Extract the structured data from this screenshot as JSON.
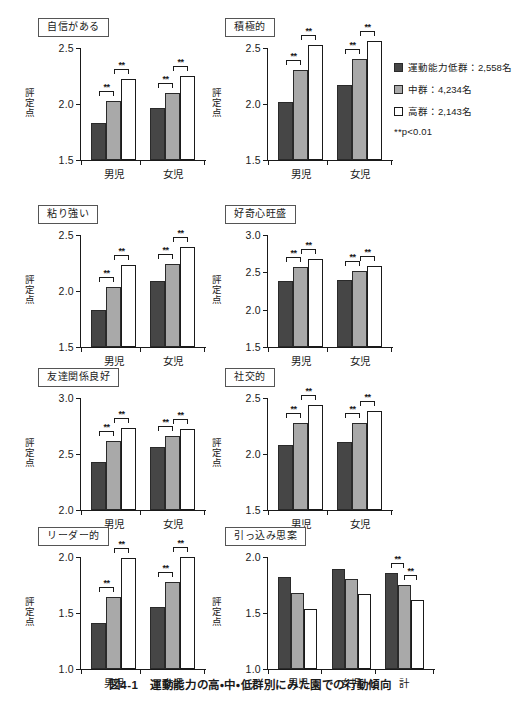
{
  "figure": {
    "caption": "図4-1　運動能力の高・中・低群別にみた園での行動傾向",
    "y_axis_label": "評定点",
    "significance_note": "**p<0.01",
    "stars": "**"
  },
  "legend": {
    "items": [
      {
        "key": "low",
        "label": "運動能力低群：2,558名",
        "color": "#464646"
      },
      {
        "key": "mid",
        "label": "中群：4,234名",
        "color": "#a9a9a9"
      },
      {
        "key": "high",
        "label": "高群：2,143名",
        "color": "#ffffff"
      }
    ],
    "pvalue": "**p<0.01"
  },
  "chart_data": [
    {
      "id": "panel-confidence",
      "type": "bar",
      "title": "自信がある",
      "ylabel": "評定点",
      "ylim": [
        1.5,
        2.5
      ],
      "yticks": [
        1.5,
        2.0,
        2.5
      ],
      "ytick_labels": [
        "1.5",
        "2.0",
        "2.5"
      ],
      "categories": [
        "男児",
        "女児"
      ],
      "series": [
        {
          "name": "運動能力低群：2,558名",
          "key": "low",
          "values": [
            1.83,
            1.96
          ]
        },
        {
          "name": "中群：4,234名",
          "key": "mid",
          "values": [
            2.03,
            2.1
          ]
        },
        {
          "name": "高群：2,143名",
          "key": "high",
          "values": [
            2.22,
            2.25
          ]
        }
      ],
      "significance": [
        {
          "group": 0,
          "between": [
            0,
            1
          ],
          "stars": "**"
        },
        {
          "group": 0,
          "between": [
            1,
            2
          ],
          "stars": "**"
        },
        {
          "group": 1,
          "between": [
            0,
            1
          ],
          "stars": "**"
        },
        {
          "group": 1,
          "between": [
            1,
            2
          ],
          "stars": "**"
        }
      ]
    },
    {
      "id": "panel-active",
      "type": "bar",
      "title": "積極的",
      "ylabel": "評定点",
      "ylim": [
        1.5,
        2.5
      ],
      "yticks": [
        1.5,
        2.0,
        2.5
      ],
      "ytick_labels": [
        "1.5",
        "2.0",
        "2.5"
      ],
      "categories": [
        "男児",
        "女児"
      ],
      "series": [
        {
          "name": "運動能力低群：2,558名",
          "key": "low",
          "values": [
            2.02,
            2.17
          ]
        },
        {
          "name": "中群：4,234名",
          "key": "mid",
          "values": [
            2.3,
            2.4
          ]
        },
        {
          "name": "高群：2,143名",
          "key": "high",
          "values": [
            2.53,
            2.56
          ]
        }
      ],
      "significance": [
        {
          "group": 0,
          "between": [
            0,
            1
          ],
          "stars": "**"
        },
        {
          "group": 0,
          "between": [
            1,
            2
          ],
          "stars": "**"
        },
        {
          "group": 1,
          "between": [
            0,
            1
          ],
          "stars": "**"
        },
        {
          "group": 1,
          "between": [
            1,
            2
          ],
          "stars": "**"
        }
      ]
    },
    {
      "id": "panel-persistent",
      "type": "bar",
      "title": "粘り強い",
      "ylabel": "評定点",
      "ylim": [
        1.5,
        2.5
      ],
      "yticks": [
        1.5,
        2.0,
        2.5
      ],
      "ytick_labels": [
        "1.5",
        "2.0",
        "2.5"
      ],
      "categories": [
        "男児",
        "女児"
      ],
      "series": [
        {
          "name": "運動能力低群：2,558名",
          "key": "low",
          "values": [
            1.83,
            2.09
          ]
        },
        {
          "name": "中群：4,234名",
          "key": "mid",
          "values": [
            2.04,
            2.24
          ]
        },
        {
          "name": "高群：2,143名",
          "key": "high",
          "values": [
            2.23,
            2.39
          ]
        }
      ],
      "significance": [
        {
          "group": 0,
          "between": [
            0,
            1
          ],
          "stars": "**"
        },
        {
          "group": 0,
          "between": [
            1,
            2
          ],
          "stars": "**"
        },
        {
          "group": 1,
          "between": [
            0,
            1
          ],
          "stars": "**"
        },
        {
          "group": 1,
          "between": [
            1,
            2
          ],
          "stars": "**"
        }
      ]
    },
    {
      "id": "panel-curious",
      "type": "bar",
      "title": "好奇心旺盛",
      "ylabel": "評定点",
      "ylim": [
        1.5,
        3.0
      ],
      "yticks": [
        1.5,
        2.0,
        2.5,
        3.0
      ],
      "ytick_labels": [
        "1.5",
        "2.0",
        "2.5",
        "3.0"
      ],
      "categories": [
        "男児",
        "女児"
      ],
      "series": [
        {
          "name": "運動能力低群：2,558名",
          "key": "low",
          "values": [
            2.38,
            2.4
          ]
        },
        {
          "name": "中群：4,234名",
          "key": "mid",
          "values": [
            2.57,
            2.52
          ]
        },
        {
          "name": "高群：2,143名",
          "key": "high",
          "values": [
            2.68,
            2.59
          ]
        }
      ],
      "significance": [
        {
          "group": 0,
          "between": [
            0,
            1
          ],
          "stars": "**"
        },
        {
          "group": 0,
          "between": [
            1,
            2
          ],
          "stars": "**"
        },
        {
          "group": 1,
          "between": [
            0,
            1
          ],
          "stars": "**"
        },
        {
          "group": 1,
          "between": [
            1,
            2
          ],
          "stars": "**"
        }
      ]
    },
    {
      "id": "panel-friendship",
      "type": "bar",
      "title": "友達関係良好",
      "ylabel": "評定点",
      "ylim": [
        2.0,
        3.0
      ],
      "yticks": [
        2.0,
        2.5,
        3.0
      ],
      "ytick_labels": [
        "2.0",
        "2.5",
        "3.0"
      ],
      "categories": [
        "男児",
        "女児"
      ],
      "series": [
        {
          "name": "運動能力低群：2,558名",
          "key": "low",
          "values": [
            2.43,
            2.56
          ]
        },
        {
          "name": "中群：4,234名",
          "key": "mid",
          "values": [
            2.62,
            2.66
          ]
        },
        {
          "name": "高群：2,143名",
          "key": "high",
          "values": [
            2.73,
            2.72
          ]
        }
      ],
      "significance": [
        {
          "group": 0,
          "between": [
            0,
            1
          ],
          "stars": "**"
        },
        {
          "group": 0,
          "between": [
            1,
            2
          ],
          "stars": "**"
        },
        {
          "group": 1,
          "between": [
            0,
            1
          ],
          "stars": "**"
        },
        {
          "group": 1,
          "between": [
            1,
            2
          ],
          "stars": "**"
        }
      ]
    },
    {
      "id": "panel-sociable",
      "type": "bar",
      "title": "社交的",
      "ylabel": "評定点",
      "ylim": [
        1.5,
        2.5
      ],
      "yticks": [
        1.5,
        2.0,
        2.5
      ],
      "ytick_labels": [
        "1.5",
        "2.0",
        "2.5"
      ],
      "categories": [
        "男児",
        "女児"
      ],
      "series": [
        {
          "name": "運動能力低群：2,558名",
          "key": "low",
          "values": [
            2.08,
            2.11
          ]
        },
        {
          "name": "中群：4,234名",
          "key": "mid",
          "values": [
            2.28,
            2.28
          ]
        },
        {
          "name": "高群：2,143名",
          "key": "high",
          "values": [
            2.44,
            2.38
          ]
        }
      ],
      "significance": [
        {
          "group": 0,
          "between": [
            0,
            1
          ],
          "stars": "**"
        },
        {
          "group": 0,
          "between": [
            1,
            2
          ],
          "stars": "**"
        },
        {
          "group": 1,
          "between": [
            0,
            1
          ],
          "stars": "**"
        },
        {
          "group": 1,
          "between": [
            1,
            2
          ],
          "stars": "**"
        }
      ]
    },
    {
      "id": "panel-leader",
      "type": "bar",
      "title": "リーダー的",
      "ylabel": "評定点",
      "ylim": [
        1.0,
        2.0
      ],
      "yticks": [
        1.0,
        1.5,
        2.0
      ],
      "ytick_labels": [
        "1.0",
        "1.5",
        "2.0"
      ],
      "categories": [
        "男児",
        "女児"
      ],
      "series": [
        {
          "name": "運動能力低群：2,558名",
          "key": "low",
          "values": [
            1.41,
            1.55
          ]
        },
        {
          "name": "中群：4,234名",
          "key": "mid",
          "values": [
            1.64,
            1.78
          ]
        },
        {
          "name": "高群：2,143名",
          "key": "high",
          "values": [
            1.99,
            2.0
          ]
        }
      ],
      "significance": [
        {
          "group": 0,
          "between": [
            0,
            1
          ],
          "stars": "**"
        },
        {
          "group": 0,
          "between": [
            1,
            2
          ],
          "stars": "**"
        },
        {
          "group": 1,
          "between": [
            0,
            1
          ],
          "stars": "**"
        },
        {
          "group": 1,
          "between": [
            1,
            2
          ],
          "stars": "**"
        }
      ]
    },
    {
      "id": "panel-withdrawn",
      "type": "bar",
      "title": "引っ込み思案",
      "ylabel": "評定点",
      "ylim": [
        1.0,
        2.0
      ],
      "yticks": [
        1.0,
        1.5,
        2.0
      ],
      "ytick_labels": [
        "1.0",
        "1.5",
        "2.0"
      ],
      "categories": [
        "男児",
        "女児",
        "計"
      ],
      "series": [
        {
          "name": "運動能力低群：2,558名",
          "key": "low",
          "values": [
            1.82,
            1.89,
            1.86
          ]
        },
        {
          "name": "中群：4,234名",
          "key": "mid",
          "values": [
            1.68,
            1.8,
            1.75
          ]
        },
        {
          "name": "高群：2,143名",
          "key": "high",
          "values": [
            1.54,
            1.67,
            1.62
          ]
        }
      ],
      "significance": [
        {
          "group": 2,
          "between": [
            0,
            1
          ],
          "stars": "**"
        },
        {
          "group": 2,
          "between": [
            1,
            2
          ],
          "stars": "**"
        }
      ]
    }
  ]
}
